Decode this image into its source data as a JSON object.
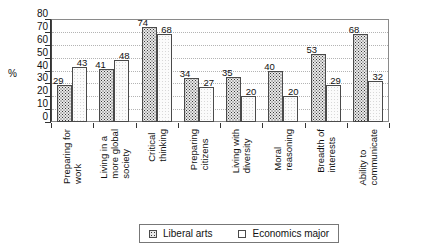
{
  "chart_data": {
    "type": "bar",
    "title": "",
    "xlabel": "",
    "ylabel": "%",
    "ylim": [
      0,
      80
    ],
    "ytick_step": 10,
    "yticks": [
      80,
      70,
      60,
      50,
      40,
      30,
      20,
      10,
      0
    ],
    "grid": true,
    "legend_position": "bottom-center",
    "categories": [
      "Preparing for work",
      "Living in a more global society",
      "Critical thinking",
      "Preparing citizens",
      "Living with diversity",
      "Moral reasoning",
      "Breadth of interests",
      "Ability to communicate"
    ],
    "category_lines": [
      [
        "Preparing for",
        "work"
      ],
      [
        "Living in a",
        "more global",
        "society"
      ],
      [
        "Critical",
        "thinking"
      ],
      [
        "Preparing",
        "citizens"
      ],
      [
        "Living with",
        "diversity"
      ],
      [
        "Moral",
        "reasoning"
      ],
      [
        "Breadth of",
        "interests"
      ],
      [
        "Ability to",
        "communicate"
      ]
    ],
    "series": [
      {
        "name": "Liberal arts",
        "fill": "dotted",
        "color": "#e8e8e8",
        "values": [
          29,
          41,
          74,
          34,
          35,
          40,
          53,
          68
        ]
      },
      {
        "name": "Economics major",
        "fill": "plain",
        "color": "#fbfbfb",
        "values": [
          43,
          48,
          68,
          27,
          20,
          20,
          29,
          32
        ]
      }
    ]
  },
  "legend": {
    "items": [
      {
        "label": "Liberal arts"
      },
      {
        "label": "Economics major"
      }
    ]
  }
}
